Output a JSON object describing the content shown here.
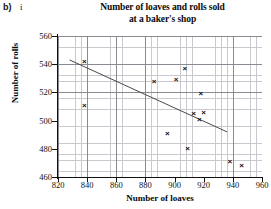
{
  "question": {
    "part_label": "b)",
    "sub_label": "i"
  },
  "chart_data": {
    "type": "scatter",
    "title": "Number of loaves and rolls sold at a baker's shop",
    "title_line1": "Number of loaves and rolls sold",
    "title_line2": "at a baker's shop",
    "xlabel": "Number of loaves",
    "ylabel": "Number of rolls",
    "xlim": [
      820,
      960
    ],
    "ylim": [
      460,
      560
    ],
    "x_ticks": [
      820,
      840,
      860,
      880,
      900,
      920,
      940,
      960
    ],
    "y_ticks": [
      460,
      480,
      500,
      520,
      540,
      560
    ],
    "x_major_step": 20,
    "y_major_step": 20,
    "x_minor_step": 4,
    "y_minor_step": 4,
    "grid": true,
    "legend": null,
    "marker": "x",
    "marker_glyph": "×",
    "marker_color": "#0d0d0d",
    "points": [
      {
        "x": 838,
        "y": 542
      },
      {
        "x": 838,
        "y": 511
      },
      {
        "x": 886,
        "y": 528
      },
      {
        "x": 895,
        "y": 491
      },
      {
        "x": 901,
        "y": 529
      },
      {
        "x": 907,
        "y": 537
      },
      {
        "x": 909,
        "y": 480
      },
      {
        "x": 913,
        "y": 505
      },
      {
        "x": 917,
        "y": 501
      },
      {
        "x": 918,
        "y": 519
      },
      {
        "x": 920,
        "y": 506
      },
      {
        "x": 938,
        "y": 471
      },
      {
        "x": 946,
        "y": 468
      }
    ],
    "trend_line": {
      "label": "line of best fit",
      "x1": 828,
      "y1": 543,
      "x2": 936,
      "y2": 492,
      "color": "#4a4a4a"
    },
    "annotations": []
  }
}
